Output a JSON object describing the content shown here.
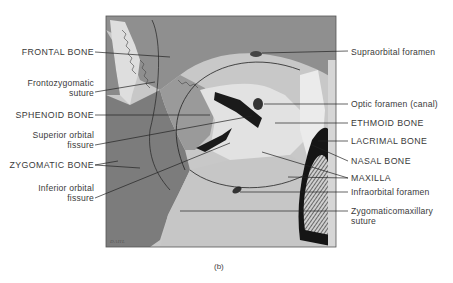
{
  "figure": {
    "caption": "(b)",
    "signature": "DAHL",
    "colors": {
      "frame": "#555555",
      "frontal": "#8f8f8f",
      "zygomatic": "#7c7c7c",
      "sphenoid": "#a9a9a9",
      "light": "#dcdcdc",
      "maxilla": "#c4c4c4",
      "dark": "#1a1a1a",
      "line": "#222222"
    }
  },
  "labels_left": [
    {
      "id": "frontal-bone",
      "text": "FRONTAL BONE"
    },
    {
      "id": "frontozygomatic-suture",
      "line1": "Frontozygomatic",
      "line2": "suture"
    },
    {
      "id": "sphenoid-bone",
      "text": "SPHENOID BONE"
    },
    {
      "id": "superior-orbital-fissure",
      "line1": "Superior orbital",
      "line2": "fissure"
    },
    {
      "id": "zygomatic-bone",
      "text": "ZYGOMATIC BONE"
    },
    {
      "id": "inferior-orbital-fissure",
      "line1": "Inferior orbital",
      "line2": "fissure"
    }
  ],
  "labels_right": [
    {
      "id": "supraorbital-foramen",
      "text": "Supraorbital foramen"
    },
    {
      "id": "optic-foramen",
      "text": "Optic foramen (canal)"
    },
    {
      "id": "ethmoid-bone",
      "text": "ETHMOID BONE"
    },
    {
      "id": "lacrimal-bone",
      "text": "LACRIMAL BONE"
    },
    {
      "id": "nasal-bone",
      "text": "NASAL BONE"
    },
    {
      "id": "maxilla",
      "text": "MAXILLA"
    },
    {
      "id": "infraorbital-foramen",
      "text": "Infraorbital foramen"
    },
    {
      "id": "zygomaticomaxillary-suture",
      "line1": "Zygomaticomaxillary",
      "line2": "suture"
    }
  ]
}
